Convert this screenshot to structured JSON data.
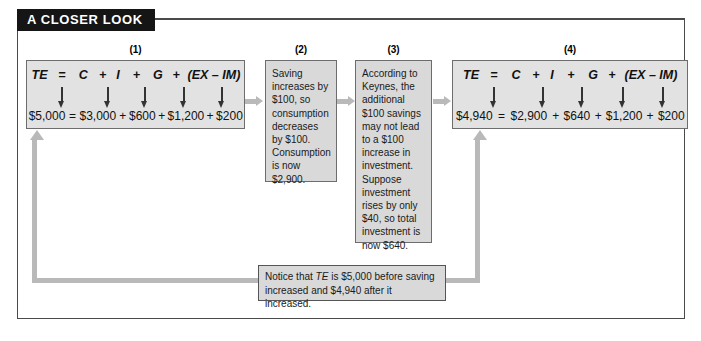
{
  "header": {
    "title": "A CLOSER LOOK"
  },
  "panels": [
    {
      "number": "(1)",
      "type": "equation",
      "symbols": [
        "TE",
        "=",
        "C",
        "+",
        "I",
        "+",
        "G",
        "+",
        "(EX – IM)"
      ],
      "values": [
        "$5,000",
        "=",
        "$3,000",
        "+",
        "$600",
        "+",
        "$1,200",
        "+",
        "$200"
      ]
    },
    {
      "number": "(2)",
      "type": "text",
      "text": "Saving increases by $100, so consumption decreases by $100. Consumption is now $2,900."
    },
    {
      "number": "(3)",
      "type": "text",
      "text": "According to Keynes, the additional $100 savings may not lead to a $100 increase in investment. Suppose investment rises by only $40, so total investment is now $640."
    },
    {
      "number": "(4)",
      "type": "equation",
      "symbols": [
        "TE",
        "=",
        "C",
        "+",
        "I",
        "+",
        "G",
        "+",
        "(EX – IM)"
      ],
      "values": [
        "$4,940",
        "=",
        "$2,900",
        "+",
        "$640",
        "+",
        "$1,200",
        "+",
        "$200"
      ]
    }
  ],
  "caption": {
    "line1_pre": "Notice that ",
    "line1_italic": "TE",
    "line1_post": " is $5,000 before saving",
    "line2": "increased and $4,940 after it increased."
  },
  "colors": {
    "banner_bg": "#151515",
    "banner_text": "#ffffff",
    "equation_panel_bg": "#e2e2e2",
    "text_panel_bg": "#d9d9d9",
    "panel_border": "#6d6d6d",
    "connector": "#b9b9b9",
    "frame": "#4a4a4a"
  }
}
